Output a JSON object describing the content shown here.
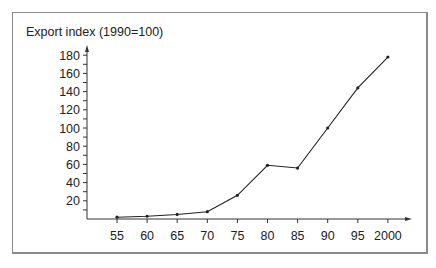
{
  "chart_data": {
    "type": "line",
    "title": "",
    "xlabel": "",
    "ylabel": "Export index (1990=100)",
    "categories": [
      "55",
      "60",
      "65",
      "70",
      "75",
      "80",
      "85",
      "90",
      "95",
      "2000"
    ],
    "series": [
      {
        "name": "Export index",
        "values": [
          2,
          3,
          5,
          8,
          26,
          59,
          56,
          100,
          144,
          178
        ]
      }
    ],
    "yticks": [
      20,
      40,
      60,
      80,
      100,
      120,
      140,
      160,
      180
    ],
    "ylim": [
      0,
      190
    ],
    "grid": false,
    "legend": "none",
    "colors": {
      "line": "#222222",
      "axis": "#333333",
      "frame": "#8a8a8a"
    }
  }
}
